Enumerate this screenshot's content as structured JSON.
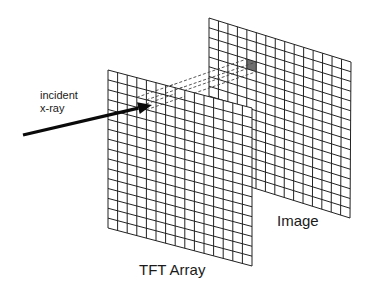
{
  "diagram": {
    "labels": {
      "incident_line1": "incident",
      "incident_line2": "x-ray",
      "tft_array": "TFT Array",
      "image": "Image"
    },
    "colors": {
      "grid_line": "#222222",
      "arrow": "#0a0a0a",
      "dashed_projection": "#444444",
      "highlighted_pixel": "#6e6e6e",
      "background": "#ffffff"
    },
    "panels": [
      {
        "name": "tft-array",
        "rows": 16,
        "cols": 15,
        "corners": {
          "top_left": [
            108,
            70
          ],
          "top_right": [
            252,
            108
          ],
          "bottom_right": [
            252,
            266
          ],
          "bottom_left": [
            108,
            228
          ]
        }
      },
      {
        "name": "image",
        "rows": 16,
        "cols": 15,
        "corners": {
          "top_left": [
            209,
            18
          ],
          "top_right": [
            351,
            62
          ],
          "bottom_right": [
            350,
            218
          ],
          "bottom_left": [
            209,
            174
          ]
        },
        "highlighted_cell": {
          "row": 3,
          "col": 4
        }
      }
    ],
    "arrow": {
      "from": [
        23,
        135
      ],
      "to": [
        152,
        105
      ]
    }
  }
}
